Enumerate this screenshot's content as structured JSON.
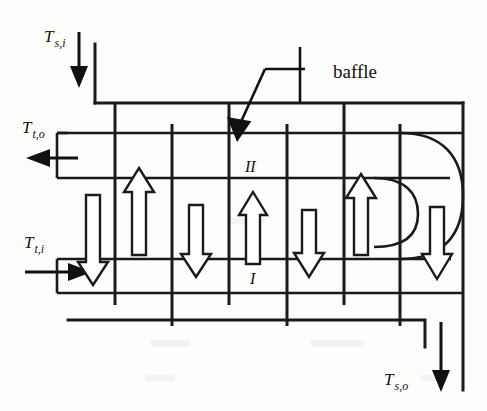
{
  "figure": {
    "type": "shell-and-tube-heat-exchanger-schematic"
  },
  "labels": {
    "shell_inlet": "Ts,i",
    "shell_inlet_main": "T",
    "shell_inlet_sub": "s,i",
    "shell_outlet": "Ts,o",
    "shell_outlet_main": "T",
    "shell_outlet_sub": "s,o",
    "tube_inlet": "Tt,i",
    "tube_inlet_main": "T",
    "tube_inlet_sub": "t,i",
    "tube_outlet": "Tt,o",
    "tube_outlet_main": "T",
    "tube_outlet_sub": "t,o",
    "baffle": "baffle",
    "pass_one": "I",
    "pass_two": "II"
  },
  "colors": {
    "line": "#1a1a1a",
    "arrow_fill": "#ffffff",
    "solid_arrow": "#111111",
    "background": "#fdfdfc"
  },
  "flow_arrows": [
    {
      "name": "tube-flow-down-1",
      "direction": "down",
      "x": 93,
      "y_top": 195,
      "y_bottom": 283
    },
    {
      "name": "shell-flow-up-1",
      "direction": "up",
      "x": 139,
      "y_top": 170,
      "y_bottom": 253
    },
    {
      "name": "tube-flow-down-2",
      "direction": "down",
      "x": 196,
      "y_top": 208,
      "y_bottom": 275
    },
    {
      "name": "shell-flow-up-2",
      "direction": "up",
      "x": 253,
      "y_top": 195,
      "y_bottom": 262
    },
    {
      "name": "tube-flow-down-3",
      "direction": "down",
      "x": 309,
      "y_top": 213,
      "y_bottom": 275
    },
    {
      "name": "shell-flow-up-3",
      "direction": "up",
      "x": 361,
      "y_top": 177,
      "y_bottom": 253
    },
    {
      "name": "tube-flow-down-4",
      "direction": "down",
      "x": 437,
      "y_top": 210,
      "y_bottom": 277
    }
  ],
  "baffles": [
    {
      "name": "baffle-1",
      "x": 115,
      "y_top": 103,
      "y_bottom": 305,
      "anchored": "top"
    },
    {
      "name": "baffle-2",
      "x": 172,
      "y_top": 124,
      "y_bottom": 326,
      "anchored": "bottom"
    },
    {
      "name": "baffle-3",
      "x": 229,
      "y_top": 103,
      "y_bottom": 305,
      "anchored": "top"
    },
    {
      "name": "baffle-4",
      "x": 287,
      "y_top": 124,
      "y_bottom": 326,
      "anchored": "bottom"
    },
    {
      "name": "baffle-5",
      "x": 344,
      "y_top": 103,
      "y_bottom": 305,
      "anchored": "top"
    },
    {
      "name": "baffle-6",
      "x": 400,
      "y_top": 124,
      "y_bottom": 326,
      "anchored": "bottom"
    }
  ]
}
